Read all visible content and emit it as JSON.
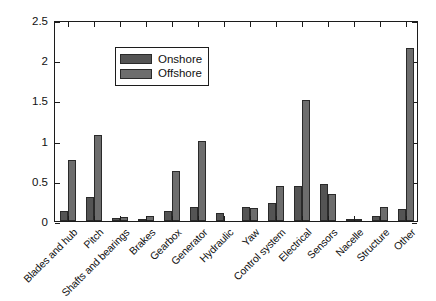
{
  "chart_data": {
    "type": "bar",
    "title": "",
    "xlabel": "",
    "ylabel": "Failures per turbine per year",
    "ylim": [
      0,
      2.5
    ],
    "ytick_values": [
      0,
      0.5,
      1,
      1.5,
      2,
      2.5
    ],
    "ytick_labels": [
      "0",
      "0.5",
      "1",
      "1.5",
      "2",
      "2.5"
    ],
    "grid": false,
    "legend_position": "upper left",
    "categories": [
      "Blades and hub",
      "Pitch",
      "Shafts and bearings",
      "Brakes",
      "Gearbox",
      "Generator",
      "Hydraulic",
      "Yaw",
      "Control system",
      "Electrical",
      "Sensors",
      "Nacelle",
      "Structure",
      "Other"
    ],
    "series": [
      {
        "name": "Onshore",
        "color": "#545454",
        "values": [
          0.12,
          0.3,
          0.04,
          0.03,
          0.13,
          0.17,
          0.1,
          0.18,
          0.23,
          0.44,
          0.46,
          0.03,
          0.06,
          0.15
        ]
      },
      {
        "name": "Offshore",
        "color": "#6d6d6d",
        "values": [
          0.76,
          1.07,
          0.05,
          0.06,
          0.62,
          1.0,
          0.0,
          0.16,
          0.44,
          1.5,
          0.33,
          0.02,
          0.17,
          2.15
        ]
      }
    ]
  },
  "legend": {
    "entries": [
      {
        "label": "Onshore",
        "color": "#545454"
      },
      {
        "label": "Offshore",
        "color": "#6d6d6d"
      }
    ]
  },
  "axes": {
    "y_title": "Failures per turbine per year"
  }
}
